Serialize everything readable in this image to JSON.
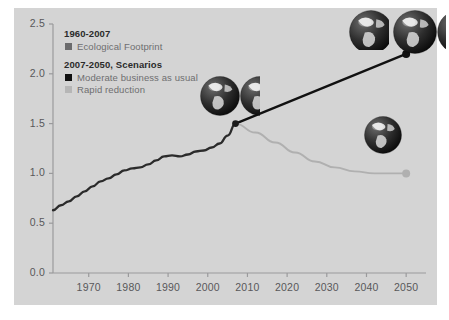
{
  "legend": {
    "section1_title": "1960-2007",
    "section1_items": [
      {
        "label": "Ecological Footprint",
        "color": "#6b6b6d",
        "name": "ecological-footprint"
      }
    ],
    "section2_title": "2007-2050, Scenarios",
    "section2_items": [
      {
        "label": "Moderate business as usual",
        "color": "#111111",
        "name": "moderate-business-as-usual"
      },
      {
        "label": "Rapid reduction",
        "color": "#b0b0b0",
        "name": "rapid-reduction"
      }
    ]
  },
  "chart_data": {
    "type": "line",
    "title": "",
    "xlabel": "",
    "ylabel": "",
    "xlim": [
      1961,
      2055
    ],
    "ylim": [
      0.0,
      2.5
    ],
    "grid": false,
    "legend_position": "top-left",
    "xticks": [
      1970,
      1980,
      1990,
      2000,
      2010,
      2020,
      2030,
      2040,
      2050
    ],
    "yticks": [
      "0.0",
      "0.5",
      "1.0",
      "1.5",
      "2.0",
      "2.5"
    ],
    "ytick_values": [
      0.0,
      0.5,
      1.0,
      1.5,
      2.0,
      2.5
    ],
    "annotations": [
      {
        "name": "globes-2007",
        "earths": "1.5",
        "at_x": 2007,
        "at_y": 1.5
      },
      {
        "name": "globes-2050-business-as-usual",
        "earths": "2.2",
        "at_x": 2050,
        "at_y": 2.2
      },
      {
        "name": "globes-2050-rapid-reduction",
        "earths": "1.0",
        "at_x": 2050,
        "at_y": 1.0
      }
    ],
    "series": [
      {
        "name": "Ecological Footprint",
        "color": "#2b2b2b",
        "x": [
          1961,
          1963,
          1965,
          1967,
          1969,
          1971,
          1973,
          1975,
          1977,
          1979,
          1981,
          1983,
          1985,
          1987,
          1989,
          1991,
          1993,
          1995,
          1997,
          1999,
          2001,
          2003,
          2005,
          2007
        ],
        "values": [
          0.63,
          0.68,
          0.72,
          0.77,
          0.82,
          0.87,
          0.92,
          0.95,
          0.99,
          1.03,
          1.05,
          1.06,
          1.09,
          1.13,
          1.17,
          1.18,
          1.17,
          1.19,
          1.22,
          1.23,
          1.26,
          1.3,
          1.38,
          1.5
        ]
      },
      {
        "name": "Moderate business as usual",
        "color": "#111111",
        "x": [
          2007,
          2050
        ],
        "values": [
          1.5,
          2.2
        ],
        "endpoint_marker": true
      },
      {
        "name": "Rapid reduction",
        "color": "#b0b0b0",
        "x": [
          2007,
          2012,
          2017,
          2022,
          2027,
          2032,
          2037,
          2042,
          2046,
          2050
        ],
        "values": [
          1.5,
          1.41,
          1.31,
          1.21,
          1.12,
          1.06,
          1.02,
          1.0,
          1.0,
          1.0
        ],
        "endpoint_marker": true
      }
    ]
  }
}
